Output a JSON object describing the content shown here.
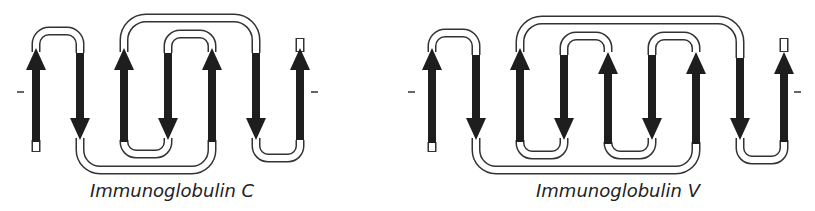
{
  "diagrams": [
    {
      "caption": "Immunoglobulin C",
      "strand_count": 7,
      "strand_directions": [
        "up",
        "down",
        "up",
        "down",
        "up",
        "down",
        "up"
      ],
      "caption_x": 172,
      "terminal_marks": [
        "-",
        "-"
      ]
    },
    {
      "caption": "Immunoglobulin V",
      "strand_count": 9,
      "strand_directions": [
        "up",
        "down",
        "up",
        "down",
        "up",
        "down",
        "up",
        "down",
        "up"
      ],
      "caption_x": 618,
      "terminal_marks": [
        "-",
        "-"
      ]
    }
  ],
  "colors": {
    "strand": "#1e1e1e",
    "loop_outline": "#333333",
    "loop_fill": "#ffffff"
  }
}
